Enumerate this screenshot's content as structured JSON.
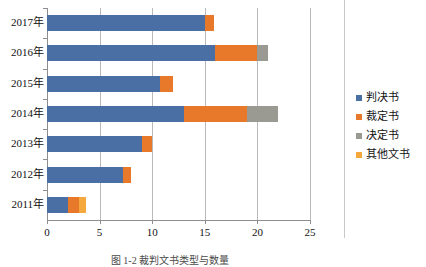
{
  "caption": "图 1-2  裁判文书类型与数量",
  "legend": {
    "position": "right",
    "items": [
      {
        "label": "判决书",
        "color": "#4a6fa5",
        "key": "panjueshu"
      },
      {
        "label": "裁定书",
        "color": "#e8792b",
        "key": "caidingshu"
      },
      {
        "label": "决定书",
        "color": "#9a9a93",
        "key": "juedingshu"
      },
      {
        "label": "其他文书",
        "color": "#f5a83c",
        "key": "qitawenshu"
      }
    ]
  },
  "axis": {
    "x_ticks": [
      "0",
      "5",
      "10",
      "15",
      "20",
      "25"
    ],
    "x_tick_values": [
      0,
      5,
      10,
      15,
      20,
      25
    ],
    "y_labels": [
      "2017年",
      "2016年",
      "2015年",
      "2014年",
      "2013年",
      "2012年",
      "2011年"
    ]
  },
  "chart_data": {
    "type": "bar",
    "orientation": "horizontal",
    "stacked": true,
    "title": "",
    "xlabel": "",
    "ylabel": "",
    "xlim": [
      0,
      25
    ],
    "grid": "vertical",
    "legend_position": "right",
    "categories": [
      "2017年",
      "2016年",
      "2015年",
      "2014年",
      "2013年",
      "2012年",
      "2011年"
    ],
    "series": [
      {
        "name": "判决书",
        "color": "#4a6fa5",
        "values": [
          15.0,
          16.0,
          10.7,
          13.0,
          9.0,
          7.2,
          2.0
        ]
      },
      {
        "name": "裁定书",
        "color": "#e8792b",
        "values": [
          0.9,
          4.0,
          1.3,
          6.0,
          1.0,
          0.8,
          1.0
        ]
      },
      {
        "name": "决定书",
        "color": "#9a9a93",
        "values": [
          0.0,
          1.0,
          0.0,
          3.0,
          0.0,
          0.0,
          0.0
        ]
      },
      {
        "name": "其他文书",
        "color": "#f5a83c",
        "values": [
          0.0,
          0.0,
          0.0,
          0.0,
          0.0,
          0.0,
          0.7
        ]
      }
    ],
    "totals": [
      15.9,
      21.0,
      12.0,
      22.0,
      10.0,
      8.0,
      3.7
    ]
  }
}
